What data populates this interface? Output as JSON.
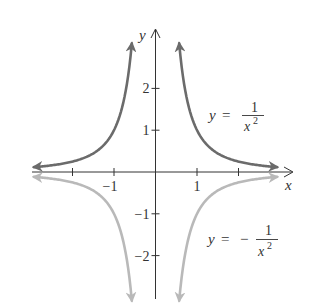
{
  "chart_data": {
    "type": "line",
    "title": "",
    "xlabel": "x",
    "ylabel": "y",
    "xlim": [
      -3.0,
      3.3
    ],
    "ylim": [
      -3.05,
      3.4
    ],
    "grid": false,
    "x_ticks": [
      -2,
      -1,
      1,
      2
    ],
    "x_tick_labels": [
      {
        "value": -1,
        "label": "−1"
      },
      {
        "value": 1,
        "label": "1"
      }
    ],
    "y_ticks": [
      -2,
      -1,
      1,
      2
    ],
    "y_tick_labels": [
      {
        "value": 2,
        "label": "2"
      },
      {
        "value": 1,
        "label": "1"
      },
      {
        "value": -1,
        "label": "−1"
      },
      {
        "value": -2,
        "label": "−2"
      }
    ],
    "series": [
      {
        "name": "y = 1/x^2",
        "function": "1/x^2",
        "color": "#6b6b6b",
        "domain_branches": [
          [
            -2.93,
            -0.57
          ],
          [
            0.57,
            2.93
          ]
        ],
        "x": [
          -2.93,
          -2.5,
          -2,
          -1.5,
          -1,
          -0.8,
          -0.7,
          -0.6,
          -0.57,
          0.57,
          0.6,
          0.7,
          0.8,
          1,
          1.5,
          2,
          2.5,
          2.93
        ],
        "y": [
          0.116,
          0.16,
          0.25,
          0.444,
          1,
          1.5625,
          2.041,
          2.778,
          3.078,
          3.078,
          2.778,
          2.041,
          1.5625,
          1,
          0.444,
          0.25,
          0.16,
          0.116
        ],
        "label": {
          "lhs": "y",
          "eq": "=",
          "sign": "",
          "num": "1",
          "den": "x",
          "exp": "2"
        }
      },
      {
        "name": "y = -1/x^2",
        "function": "-1/x^2",
        "color": "#b9b9b9",
        "domain_branches": [
          [
            -2.93,
            -0.57
          ],
          [
            0.57,
            2.93
          ]
        ],
        "x": [
          -2.93,
          -2.5,
          -2,
          -1.5,
          -1,
          -0.8,
          -0.7,
          -0.6,
          -0.57,
          0.57,
          0.6,
          0.7,
          0.8,
          1,
          1.5,
          2,
          2.5,
          2.93
        ],
        "y": [
          -0.116,
          -0.16,
          -0.25,
          -0.444,
          -1,
          -1.5625,
          -2.041,
          -2.778,
          -3.078,
          -3.078,
          -2.778,
          -2.041,
          -1.5625,
          -1,
          -0.444,
          -0.25,
          -0.16,
          -0.116
        ],
        "label": {
          "lhs": "y",
          "eq": "=",
          "sign": "−",
          "num": "1",
          "den": "x",
          "exp": "2"
        }
      }
    ],
    "annotations": [
      {
        "text": "y = 1/x^2",
        "near": [
          2.2,
          1.2
        ]
      },
      {
        "text": "y = -1/x^2",
        "near": [
          2.2,
          -1.6
        ]
      }
    ]
  },
  "axes": {
    "x_name": "x",
    "y_name": "y",
    "axis_color": "#333333"
  }
}
